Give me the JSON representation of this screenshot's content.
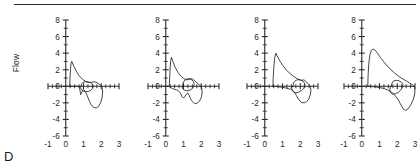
{
  "figure": {
    "panel_letter": "D",
    "ylabel": "Flow",
    "panel_count": 4,
    "line_color": "#262626",
    "axis_color": "#2b2b2b",
    "background": "#ffffff",
    "top_rule_visible": "true"
  },
  "chart_data": {
    "type": "line",
    "title": "",
    "subtitle": "",
    "panel_label": "D",
    "xlabel": "",
    "ylabel": "Flow",
    "xlim": [
      -1,
      3
    ],
    "ylim": [
      -6,
      8
    ],
    "xticks": [
      -1,
      0,
      1,
      2,
      3
    ],
    "yticks": [
      -6,
      -4,
      -2,
      0,
      2,
      4,
      6,
      8
    ],
    "xticklabels": [
      "-1",
      "0",
      "1",
      "2",
      "3"
    ],
    "yticklabels": [
      "-6",
      "-4",
      "-2",
      "0",
      "2",
      "4",
      "6",
      "8"
    ],
    "x_minor_tick_interval": 0.25,
    "y_minor_tick_interval": 1,
    "grid": false,
    "legend": false,
    "legend_position": "none",
    "axis_style": "crossed-spines-at-origin",
    "annotations": [
      "D"
    ],
    "series": [
      {
        "name": "loop-1",
        "panel": 1,
        "peak_expiratory_flow": 3.0,
        "peak_inspiratory_flow": -2.6,
        "volume_range": [
          0.2,
          2.1
        ],
        "points": [
          [
            0.22,
            0.0
          ],
          [
            0.24,
            1.0
          ],
          [
            0.27,
            2.1
          ],
          [
            0.3,
            2.8
          ],
          [
            0.34,
            3.0
          ],
          [
            0.46,
            2.4
          ],
          [
            0.6,
            1.8
          ],
          [
            0.76,
            1.25
          ],
          [
            0.94,
            0.85
          ],
          [
            1.12,
            0.6
          ],
          [
            1.3,
            0.45
          ],
          [
            1.46,
            0.48
          ],
          [
            1.58,
            0.55
          ],
          [
            1.7,
            0.5
          ],
          [
            1.82,
            0.35
          ],
          [
            1.92,
            0.18
          ],
          [
            2.02,
            0.02
          ],
          [
            2.06,
            -0.25
          ],
          [
            2.08,
            -0.7
          ],
          [
            2.05,
            -1.35
          ],
          [
            1.97,
            -1.95
          ],
          [
            1.86,
            -2.4
          ],
          [
            1.72,
            -2.62
          ],
          [
            1.56,
            -2.55
          ],
          [
            1.44,
            -2.25
          ],
          [
            1.34,
            -1.85
          ],
          [
            1.26,
            -1.4
          ],
          [
            1.18,
            -0.98
          ],
          [
            1.1,
            -0.62
          ],
          [
            1.02,
            -0.4
          ],
          [
            0.94,
            -0.55
          ],
          [
            0.88,
            -0.82
          ],
          [
            0.84,
            -1.02
          ],
          [
            0.82,
            -0.75
          ],
          [
            0.8,
            -0.45
          ],
          [
            0.78,
            -0.18
          ],
          [
            0.76,
            0.0
          ],
          [
            0.55,
            0.0
          ],
          [
            0.35,
            0.0
          ],
          [
            0.22,
            0.0
          ]
        ]
      },
      {
        "name": "loop-1-inner",
        "panel": 1,
        "peak_expiratory_flow": 0.55,
        "peak_inspiratory_flow": -0.65,
        "volume_range": [
          0.82,
          1.55
        ],
        "points": [
          [
            0.86,
            0.0
          ],
          [
            0.9,
            0.32
          ],
          [
            0.98,
            0.5
          ],
          [
            1.12,
            0.55
          ],
          [
            1.28,
            0.52
          ],
          [
            1.42,
            0.42
          ],
          [
            1.52,
            0.25
          ],
          [
            1.55,
            0.02
          ],
          [
            1.52,
            -0.25
          ],
          [
            1.42,
            -0.48
          ],
          [
            1.28,
            -0.62
          ],
          [
            1.12,
            -0.65
          ],
          [
            0.98,
            -0.56
          ],
          [
            0.88,
            -0.38
          ],
          [
            0.84,
            -0.16
          ],
          [
            0.86,
            0.0
          ]
        ]
      },
      {
        "name": "loop-2",
        "panel": 2,
        "peak_expiratory_flow": 3.5,
        "peak_inspiratory_flow": -2.1,
        "volume_range": [
          0.18,
          2.05
        ],
        "points": [
          [
            0.2,
            0.0
          ],
          [
            0.22,
            1.1
          ],
          [
            0.25,
            2.3
          ],
          [
            0.28,
            3.1
          ],
          [
            0.32,
            3.5
          ],
          [
            0.42,
            2.9
          ],
          [
            0.54,
            2.25
          ],
          [
            0.68,
            1.7
          ],
          [
            0.84,
            1.25
          ],
          [
            1.0,
            0.95
          ],
          [
            1.16,
            0.78
          ],
          [
            1.3,
            0.82
          ],
          [
            1.42,
            0.92
          ],
          [
            1.52,
            0.85
          ],
          [
            1.64,
            0.65
          ],
          [
            1.76,
            0.42
          ],
          [
            1.88,
            0.18
          ],
          [
            1.98,
            0.02
          ],
          [
            2.03,
            -0.3
          ],
          [
            2.05,
            -0.8
          ],
          [
            2.0,
            -1.35
          ],
          [
            1.9,
            -1.8
          ],
          [
            1.76,
            -2.05
          ],
          [
            1.62,
            -2.08
          ],
          [
            1.5,
            -1.85
          ],
          [
            1.4,
            -1.5
          ],
          [
            1.32,
            -1.12
          ],
          [
            1.24,
            -0.8
          ],
          [
            1.16,
            -0.95
          ],
          [
            1.08,
            -1.22
          ],
          [
            1.0,
            -1.42
          ],
          [
            0.92,
            -1.25
          ],
          [
            0.86,
            -0.95
          ],
          [
            0.78,
            -0.7
          ],
          [
            0.7,
            -0.52
          ],
          [
            0.6,
            -0.42
          ],
          [
            0.48,
            -0.36
          ],
          [
            0.36,
            -0.25
          ],
          [
            0.26,
            -0.1
          ],
          [
            0.2,
            0.0
          ]
        ]
      },
      {
        "name": "loop-2-inner",
        "panel": 2,
        "peak_expiratory_flow": 0.95,
        "peak_inspiratory_flow": -0.55,
        "volume_range": [
          0.9,
          1.6
        ],
        "points": [
          [
            0.94,
            0.0
          ],
          [
            0.98,
            0.4
          ],
          [
            1.06,
            0.72
          ],
          [
            1.18,
            0.88
          ],
          [
            1.32,
            0.92
          ],
          [
            1.46,
            0.8
          ],
          [
            1.56,
            0.55
          ],
          [
            1.6,
            0.22
          ],
          [
            1.56,
            -0.1
          ],
          [
            1.46,
            -0.35
          ],
          [
            1.32,
            -0.5
          ],
          [
            1.18,
            -0.55
          ],
          [
            1.04,
            -0.45
          ],
          [
            0.94,
            -0.25
          ],
          [
            0.92,
            -0.08
          ],
          [
            0.94,
            0.0
          ]
        ]
      },
      {
        "name": "loop-3",
        "panel": 3,
        "peak_expiratory_flow": 4.0,
        "peak_inspiratory_flow": -2.0,
        "volume_range": [
          0.42,
          2.6
        ],
        "points": [
          [
            0.46,
            0.0
          ],
          [
            0.48,
            1.2
          ],
          [
            0.52,
            2.5
          ],
          [
            0.56,
            3.4
          ],
          [
            0.62,
            4.0
          ],
          [
            0.74,
            3.5
          ],
          [
            0.88,
            2.95
          ],
          [
            1.04,
            2.45
          ],
          [
            1.22,
            1.95
          ],
          [
            1.42,
            1.55
          ],
          [
            1.62,
            1.2
          ],
          [
            1.8,
            0.95
          ],
          [
            1.96,
            0.78
          ],
          [
            2.08,
            0.7
          ],
          [
            2.18,
            0.78
          ],
          [
            2.26,
            0.7
          ],
          [
            2.36,
            0.5
          ],
          [
            2.46,
            0.28
          ],
          [
            2.54,
            0.08
          ],
          [
            2.58,
            -0.18
          ],
          [
            2.6,
            -0.55
          ],
          [
            2.56,
            -1.05
          ],
          [
            2.48,
            -1.52
          ],
          [
            2.36,
            -1.85
          ],
          [
            2.22,
            -2.0
          ],
          [
            2.08,
            -1.95
          ],
          [
            1.96,
            -1.72
          ],
          [
            1.86,
            -1.42
          ],
          [
            1.78,
            -1.1
          ],
          [
            1.7,
            -0.82
          ],
          [
            1.62,
            -0.6
          ],
          [
            1.54,
            -0.45
          ],
          [
            1.44,
            -0.35
          ],
          [
            1.32,
            -0.28
          ],
          [
            1.18,
            -0.2
          ],
          [
            1.0,
            -0.12
          ],
          [
            0.78,
            -0.06
          ],
          [
            0.6,
            -0.02
          ],
          [
            0.46,
            0.0
          ]
        ]
      },
      {
        "name": "loop-3-inner",
        "panel": 3,
        "peak_expiratory_flow": 0.8,
        "peak_inspiratory_flow": -0.8,
        "volume_range": [
          1.52,
          2.25
        ],
        "points": [
          [
            1.58,
            0.0
          ],
          [
            1.62,
            0.4
          ],
          [
            1.72,
            0.68
          ],
          [
            1.86,
            0.8
          ],
          [
            2.02,
            0.78
          ],
          [
            2.16,
            0.62
          ],
          [
            2.24,
            0.38
          ],
          [
            2.25,
            0.08
          ],
          [
            2.2,
            -0.22
          ],
          [
            2.08,
            -0.5
          ],
          [
            1.92,
            -0.7
          ],
          [
            1.76,
            -0.8
          ],
          [
            1.62,
            -0.68
          ],
          [
            1.54,
            -0.42
          ],
          [
            1.52,
            -0.18
          ],
          [
            1.58,
            0.0
          ]
        ]
      },
      {
        "name": "loop-4",
        "panel": 4,
        "peak_expiratory_flow": 4.5,
        "peak_inspiratory_flow": -2.9,
        "volume_range": [
          0.3,
          3.0
        ],
        "points": [
          [
            0.34,
            0.0
          ],
          [
            0.36,
            1.4
          ],
          [
            0.4,
            2.8
          ],
          [
            0.46,
            3.8
          ],
          [
            0.54,
            4.35
          ],
          [
            0.64,
            4.5
          ],
          [
            0.76,
            4.35
          ],
          [
            0.9,
            3.95
          ],
          [
            1.06,
            3.45
          ],
          [
            1.24,
            2.95
          ],
          [
            1.44,
            2.45
          ],
          [
            1.64,
            2.0
          ],
          [
            1.84,
            1.62
          ],
          [
            2.04,
            1.28
          ],
          [
            2.22,
            1.0
          ],
          [
            2.4,
            0.78
          ],
          [
            2.56,
            0.58
          ],
          [
            2.7,
            0.4
          ],
          [
            2.82,
            0.22
          ],
          [
            2.92,
            0.06
          ],
          [
            2.98,
            -0.2
          ],
          [
            3.0,
            -0.6
          ],
          [
            2.96,
            -1.15
          ],
          [
            2.88,
            -1.7
          ],
          [
            2.76,
            -2.25
          ],
          [
            2.62,
            -2.7
          ],
          [
            2.48,
            -2.9
          ],
          [
            2.36,
            -2.8
          ],
          [
            2.26,
            -2.45
          ],
          [
            2.16,
            -2.05
          ],
          [
            2.06,
            -1.65
          ],
          [
            1.94,
            -1.28
          ],
          [
            1.82,
            -0.98
          ],
          [
            1.7,
            -0.75
          ],
          [
            1.58,
            -0.58
          ],
          [
            1.44,
            -0.42
          ],
          [
            1.26,
            -0.28
          ],
          [
            1.04,
            -0.16
          ],
          [
            0.78,
            -0.08
          ],
          [
            0.52,
            -0.02
          ],
          [
            0.34,
            0.0
          ]
        ]
      },
      {
        "name": "loop-4-inner",
        "panel": 4,
        "peak_expiratory_flow": 0.72,
        "peak_inspiratory_flow": -0.95,
        "volume_range": [
          1.58,
          2.32
        ],
        "points": [
          [
            1.66,
            0.0
          ],
          [
            1.7,
            0.38
          ],
          [
            1.8,
            0.65
          ],
          [
            1.94,
            0.72
          ],
          [
            2.1,
            0.66
          ],
          [
            2.24,
            0.48
          ],
          [
            2.32,
            0.22
          ],
          [
            2.3,
            -0.1
          ],
          [
            2.2,
            -0.45
          ],
          [
            2.06,
            -0.72
          ],
          [
            1.9,
            -0.9
          ],
          [
            1.74,
            -0.95
          ],
          [
            1.62,
            -0.75
          ],
          [
            1.58,
            -0.45
          ],
          [
            1.6,
            -0.18
          ],
          [
            1.66,
            0.0
          ]
        ]
      }
    ]
  }
}
